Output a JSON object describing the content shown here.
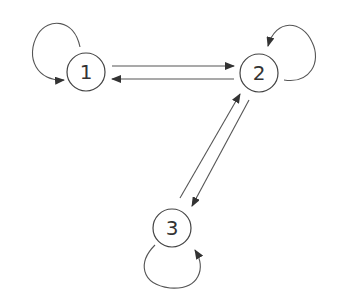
{
  "diagram": {
    "type": "state-transition-graph",
    "colors": {
      "stroke": "#555555",
      "text": "#333333",
      "background": "#ffffff"
    },
    "nodes": [
      {
        "id": "1",
        "label": "1",
        "cx": 86,
        "cy": 72
      },
      {
        "id": "2",
        "label": "2",
        "cx": 259,
        "cy": 73
      },
      {
        "id": "3",
        "label": "3",
        "cx": 172,
        "cy": 228
      }
    ],
    "edges": [
      {
        "from": "1",
        "to": "1",
        "kind": "self-loop"
      },
      {
        "from": "1",
        "to": "2",
        "kind": "directed"
      },
      {
        "from": "2",
        "to": "1",
        "kind": "directed"
      },
      {
        "from": "2",
        "to": "2",
        "kind": "self-loop"
      },
      {
        "from": "2",
        "to": "3",
        "kind": "directed"
      },
      {
        "from": "3",
        "to": "2",
        "kind": "directed"
      },
      {
        "from": "3",
        "to": "3",
        "kind": "self-loop"
      }
    ]
  }
}
